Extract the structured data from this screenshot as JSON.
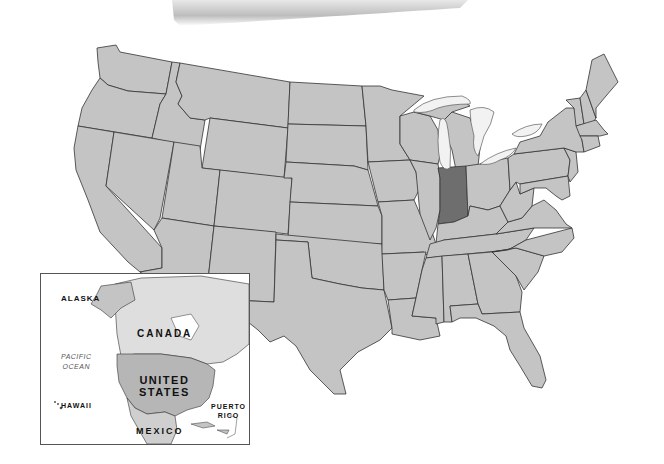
{
  "map": {
    "title": "United States map with Indiana highlighted",
    "highlighted_state": "Indiana",
    "colors": {
      "state_fill": "#c4c4c4",
      "highlight_fill": "#6e6e6e",
      "border": "#333333",
      "water": "#f2f2f2",
      "background": "#ffffff"
    }
  },
  "inset": {
    "labels": {
      "alaska": "ALASKA",
      "canada": "CANADA",
      "united": "UNITED",
      "states": "STATES",
      "pacific": "PACIFIC",
      "ocean": "OCEAN",
      "hawaii": "HAWAII",
      "puerto": "PUERTO",
      "rico": "RICO",
      "mexico": "MEXICO"
    }
  }
}
